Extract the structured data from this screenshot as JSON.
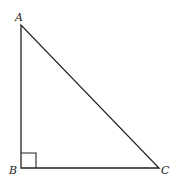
{
  "diagram": {
    "type": "right-triangle",
    "vertices": {
      "A": {
        "label": "A",
        "x": 21,
        "y": 25
      },
      "B": {
        "label": "B",
        "x": 21,
        "y": 168
      },
      "C": {
        "label": "C",
        "x": 159,
        "y": 168
      }
    },
    "right_angle_at": "B",
    "right_angle_marker_size": 15,
    "stroke_color": "#222222",
    "background": "#ffffff"
  }
}
